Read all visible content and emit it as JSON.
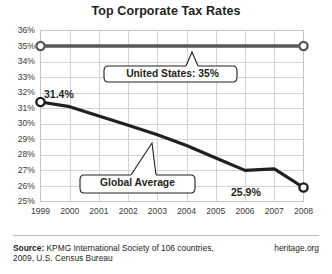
{
  "chart_data": {
    "type": "line",
    "title": "Top Corporate Tax Rates",
    "xlabel": "",
    "ylabel": "",
    "x": [
      1999,
      2000,
      2001,
      2002,
      2003,
      2004,
      2005,
      2006,
      2007,
      2008
    ],
    "categories": [
      "1999",
      "2000",
      "2001",
      "2002",
      "2003",
      "2004",
      "2005",
      "2006",
      "2007",
      "2008"
    ],
    "ylim": [
      25,
      36
    ],
    "ytick_labels": [
      "36%",
      "35%",
      "34%",
      "33%",
      "32%",
      "31%",
      "30%",
      "29%",
      "28%",
      "27%",
      "26%",
      "25%"
    ],
    "ytick_values": [
      36,
      35,
      34,
      33,
      32,
      31,
      30,
      29,
      28,
      27,
      26,
      25
    ],
    "grid": true,
    "legend_position": "inline-callout",
    "series": [
      {
        "name": "United States",
        "values": [
          35.0,
          35.0,
          35.0,
          35.0,
          35.0,
          35.0,
          35.0,
          35.0,
          35.0,
          35.0
        ],
        "color": "#58595b",
        "marker": "open-circle-endpoints"
      },
      {
        "name": "Global Average",
        "values": [
          31.4,
          31.1,
          30.5,
          29.9,
          29.3,
          28.6,
          27.8,
          27.0,
          27.1,
          25.9
        ],
        "color": "#231f20",
        "marker": "open-circle-endpoints"
      }
    ],
    "annotations": [
      {
        "name": "us-callout",
        "text": "United States: 35%",
        "series": "United States"
      },
      {
        "name": "global-callout",
        "text": "Global Average",
        "series": "Global Average"
      },
      {
        "name": "start-value-label",
        "text": "31.4%",
        "x": 1999,
        "y": 31.4
      },
      {
        "name": "end-value-label",
        "text": "25.9%",
        "x": 2008,
        "y": 25.9
      }
    ]
  },
  "footer": {
    "source_label": "Source:",
    "source_text": "KPMG International Society of 106 countries, 2009, U.S. Census Bureau",
    "brand": "heritage.org"
  }
}
